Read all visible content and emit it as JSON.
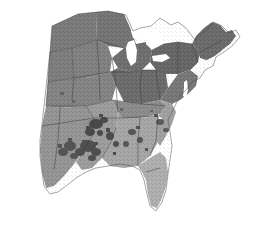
{
  "figure": {
    "kind": "raster-map",
    "caption": "",
    "background_color": "#ffffff",
    "width": 260,
    "height": 226
  },
  "map": {
    "projection_hint": "conic",
    "extent_description": "Central and eastern United States, from the northern Great Plains and Texas east to the Atlantic coast and New England",
    "water_color": "#ffffff",
    "border_color": "#3c3c3c",
    "classes": [
      {
        "name": "very-dark",
        "color": "#4f4f4f",
        "label": "highest"
      },
      {
        "name": "dark",
        "color": "#6b6b6b",
        "label": "high"
      },
      {
        "name": "medium",
        "color": "#7d7d7d",
        "label": "moderate"
      },
      {
        "name": "light",
        "color": "#9e9e9e",
        "label": "low"
      },
      {
        "name": "very-light",
        "color": "#b4b4b4",
        "label": "lowest"
      }
    ],
    "regions": [
      {
        "name": "northern-plains",
        "class": "medium",
        "color": "#7a7a7a"
      },
      {
        "name": "upper-midwest",
        "class": "medium",
        "color": "#747474"
      },
      {
        "name": "great-lakes-states",
        "class": "dark",
        "color": "#6e6e6e"
      },
      {
        "name": "ohio-valley",
        "class": "dark",
        "color": "#6b6b6b"
      },
      {
        "name": "northeast",
        "class": "dark",
        "color": "#666666"
      },
      {
        "name": "new-england",
        "class": "dark",
        "color": "#6a6a6a"
      },
      {
        "name": "mid-atlantic",
        "class": "medium",
        "color": "#777777"
      },
      {
        "name": "central-plains",
        "class": "medium",
        "color": "#808080"
      },
      {
        "name": "lower-mississippi-valley",
        "class": "light",
        "color": "#9c9c9c"
      },
      {
        "name": "gulf-coast-south",
        "class": "light",
        "color": "#a5a5a5"
      },
      {
        "name": "southeast-coast",
        "class": "light",
        "color": "#a0a0a0"
      },
      {
        "name": "florida-peninsula",
        "class": "very-light",
        "color": "#aeaeae"
      }
    ],
    "water_bodies": [
      {
        "name": "lake-superior"
      },
      {
        "name": "lake-michigan"
      },
      {
        "name": "lake-huron"
      },
      {
        "name": "lake-erie"
      },
      {
        "name": "chesapeake-bay"
      },
      {
        "name": "gulf-of-mexico"
      },
      {
        "name": "atlantic-ocean"
      }
    ],
    "hotspot_clusters": [
      {
        "name": "arkansas-delta-cluster",
        "color": "#4a4a4a"
      },
      {
        "name": "louisiana-cluster",
        "color": "#4f4f4f"
      },
      {
        "name": "east-texas-cluster",
        "color": "#545454"
      },
      {
        "name": "mississippi-cluster",
        "color": "#4d4d4d"
      },
      {
        "name": "alabama-georgia-cluster",
        "color": "#565656"
      },
      {
        "name": "carolina-piedmont-cluster",
        "color": "#5a5a5a"
      }
    ]
  }
}
